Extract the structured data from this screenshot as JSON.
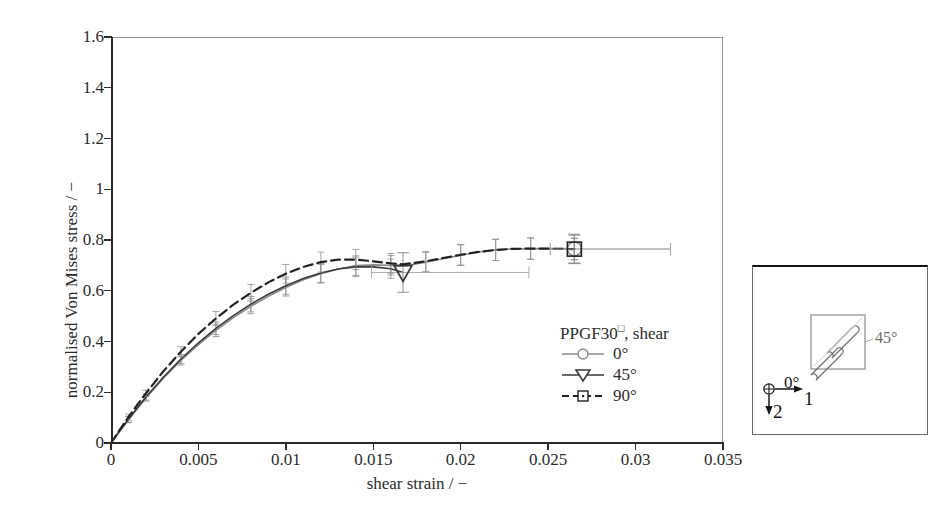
{
  "chart_data": {
    "type": "line",
    "title": "",
    "xlabel": "shear strain / −",
    "ylabel": "normalised Von Mises stress / −",
    "xlim": [
      0,
      0.035
    ],
    "ylim": [
      0,
      1.6
    ],
    "xticks": [
      "0",
      "0.005",
      "0.01",
      "0.015",
      "0.02",
      "0.025",
      "0.03",
      "0.035"
    ],
    "xtick_values": [
      0,
      0.005,
      0.01,
      0.015,
      0.02,
      0.025,
      0.03,
      0.035
    ],
    "yticks": [
      "0",
      "0.2",
      "0.4",
      "0.6",
      "0.8",
      "1",
      "1.2",
      "1.4",
      "1.6"
    ],
    "ytick_values": [
      0,
      0.2,
      0.4,
      0.6,
      0.8,
      1.0,
      1.2,
      1.4,
      1.6
    ],
    "grid": false,
    "legend_position": "inside-lower-right",
    "legend_title": "PPGF30□, shear",
    "series": [
      {
        "name": "0°",
        "color": "#8c8c8c",
        "style": "solid",
        "marker": "circle",
        "x": [
          0,
          0.0005,
          0.001,
          0.0015,
          0.002,
          0.003,
          0.004,
          0.005,
          0.006,
          0.007,
          0.008,
          0.009,
          0.01,
          0.011,
          0.012,
          0.013,
          0.014,
          0.015,
          0.016,
          0.0167,
          0.018,
          0.019,
          0.02,
          0.021,
          0.022,
          0.023,
          0.024,
          0.025,
          0.0265
        ],
        "y": [
          0,
          0.047,
          0.092,
          0.135,
          0.177,
          0.255,
          0.325,
          0.388,
          0.444,
          0.494,
          0.539,
          0.578,
          0.613,
          0.643,
          0.667,
          0.686,
          0.699,
          0.702,
          0.7,
          0.697,
          0.712,
          0.726,
          0.74,
          0.752,
          0.761,
          0.765,
          0.766,
          0.766,
          0.765
        ],
        "endpoint": {
          "x": 0.0265,
          "y": 0.765
        },
        "xerr_at_endpoint": 0.0055,
        "yerr_at_endpoint": 0.058
      },
      {
        "name": "45°",
        "color": "#3a3a3a",
        "style": "solid",
        "marker": "triangle-down",
        "x": [
          0,
          0.0005,
          0.001,
          0.0015,
          0.002,
          0.003,
          0.004,
          0.005,
          0.006,
          0.007,
          0.008,
          0.009,
          0.01,
          0.011,
          0.012,
          0.013,
          0.014,
          0.015,
          0.016,
          0.0167
        ],
        "y": [
          0,
          0.048,
          0.094,
          0.138,
          0.181,
          0.26,
          0.331,
          0.395,
          0.452,
          0.502,
          0.547,
          0.586,
          0.62,
          0.648,
          0.67,
          0.686,
          0.694,
          0.694,
          0.687,
          0.672
        ],
        "endpoint": {
          "x": 0.0167,
          "y": 0.672
        },
        "xerr_at_endpoint": 0.0072,
        "yerr_at_endpoint": 0.078
      },
      {
        "name": "90°",
        "color": "#222222",
        "style": "dashed",
        "marker": "square",
        "x": [
          0,
          0.0005,
          0.001,
          0.0015,
          0.002,
          0.003,
          0.004,
          0.005,
          0.006,
          0.007,
          0.008,
          0.009,
          0.01,
          0.011,
          0.012,
          0.013,
          0.014,
          0.015,
          0.016,
          0.0167,
          0.018,
          0.019,
          0.02,
          0.021,
          0.022,
          0.023,
          0.024,
          0.025,
          0.0265
        ],
        "y": [
          0,
          0.052,
          0.102,
          0.15,
          0.196,
          0.283,
          0.36,
          0.43,
          0.491,
          0.545,
          0.592,
          0.633,
          0.667,
          0.694,
          0.713,
          0.723,
          0.723,
          0.716,
          0.708,
          0.704,
          0.716,
          0.729,
          0.742,
          0.753,
          0.761,
          0.765,
          0.766,
          0.766,
          0.764
        ],
        "endpoint": {
          "x": 0.0265,
          "y": 0.764
        },
        "xerr_at_endpoint": 0.0055,
        "yerr_at_endpoint": 0.055
      }
    ],
    "errorbars_note": "vertical error bars along curves; long horizontal error bars at terminal markers"
  },
  "legend": {
    "title_main": "PPGF30",
    "title_sup": "□",
    "title_rest": ", shear",
    "items": [
      {
        "label": "0°",
        "marker": "circle",
        "style": "solid",
        "color": "#8c8c8c"
      },
      {
        "label": "45°",
        "marker": "triangle-down",
        "style": "solid",
        "color": "#3a3a3a"
      },
      {
        "label": "90°",
        "marker": "square",
        "style": "dashed",
        "color": "#222222"
      }
    ]
  },
  "inset": {
    "angle_45_label": "45°",
    "angle_0_label": "0°",
    "axis_1_label": "1",
    "axis_2_label": "2",
    "origin_symbol": "⊕"
  }
}
